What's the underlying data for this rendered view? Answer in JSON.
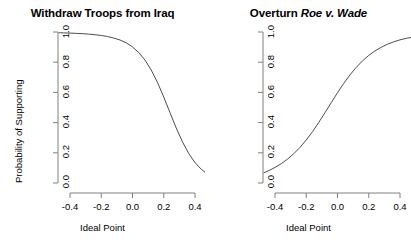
{
  "figure": {
    "background": "#ffffff",
    "line_color": "#4d4d4d",
    "axis_color": "#808080",
    "text_color": "#000000"
  },
  "panels": [
    {
      "id": "withdraw-troops",
      "title_plain": "Withdraw Troops from Iraq",
      "title_prefix": "Withdraw Troops from Iraq",
      "title_italic": "",
      "xlabel": "Ideal Point",
      "ylabel": "Probability of Supporting",
      "x_ticks": [
        "-0.4",
        "-0.2",
        "0.0",
        "0.2",
        "0.4"
      ],
      "y_ticks": [
        "0.0",
        "0.2",
        "0.4",
        "0.6",
        "0.8",
        "1.0"
      ]
    },
    {
      "id": "overturn-roe-v-wade",
      "title_plain": "Overturn Roe v. Wade",
      "title_prefix": "Overturn ",
      "title_italic": "Roe v. Wade",
      "xlabel": "Ideal Point",
      "ylabel": "",
      "x_ticks": [
        "-0.4",
        "-0.2",
        "0.0",
        "0.2",
        "0.4"
      ],
      "y_ticks": [
        "0.0",
        "0.2",
        "0.4",
        "0.6",
        "0.8",
        "1.0"
      ]
    }
  ],
  "chart_data": [
    {
      "type": "line",
      "title": "Withdraw Troops from Iraq",
      "xlabel": "Ideal Point",
      "ylabel": "Probability of Supporting",
      "xlim": [
        -0.47,
        0.47
      ],
      "ylim": [
        0.0,
        1.0
      ],
      "xticks": [
        -0.4,
        -0.2,
        0.0,
        0.2,
        0.4
      ],
      "yticks": [
        0.0,
        0.2,
        0.4,
        0.6,
        0.8,
        1.0
      ],
      "grid": false,
      "legend": "none",
      "series": [
        {
          "name": "Probability of Supporting",
          "x": [
            -0.47,
            -0.44,
            -0.4,
            -0.36,
            -0.32,
            -0.28,
            -0.24,
            -0.2,
            -0.16,
            -0.12,
            -0.08,
            -0.04,
            0.0,
            0.04,
            0.08,
            0.12,
            0.16,
            0.2,
            0.24,
            0.28,
            0.32,
            0.36,
            0.4,
            0.44,
            0.47
          ],
          "values": [
            0.995,
            0.994,
            0.993,
            0.991,
            0.989,
            0.986,
            0.982,
            0.977,
            0.97,
            0.96,
            0.947,
            0.928,
            0.901,
            0.864,
            0.814,
            0.748,
            0.665,
            0.569,
            0.466,
            0.364,
            0.272,
            0.195,
            0.135,
            0.091,
            0.066
          ]
        }
      ]
    },
    {
      "type": "line",
      "title": "Overturn Roe v. Wade",
      "xlabel": "Ideal Point",
      "ylabel": "",
      "xlim": [
        -0.47,
        0.47
      ],
      "ylim": [
        0.0,
        1.0
      ],
      "xticks": [
        -0.4,
        -0.2,
        0.0,
        0.2,
        0.4
      ],
      "yticks": [
        0.0,
        0.2,
        0.4,
        0.6,
        0.8,
        1.0
      ],
      "grid": false,
      "legend": "none",
      "series": [
        {
          "name": "Probability of Supporting",
          "x": [
            -0.47,
            -0.44,
            -0.4,
            -0.36,
            -0.32,
            -0.28,
            -0.24,
            -0.2,
            -0.16,
            -0.12,
            -0.08,
            -0.04,
            0.0,
            0.04,
            0.08,
            0.12,
            0.16,
            0.2,
            0.24,
            0.28,
            0.32,
            0.36,
            0.4,
            0.44,
            0.47
          ],
          "values": [
            0.068,
            0.082,
            0.103,
            0.128,
            0.158,
            0.194,
            0.236,
            0.285,
            0.34,
            0.401,
            0.466,
            0.532,
            0.598,
            0.66,
            0.716,
            0.766,
            0.809,
            0.845,
            0.875,
            0.899,
            0.919,
            0.935,
            0.948,
            0.958,
            0.964
          ]
        }
      ]
    }
  ]
}
